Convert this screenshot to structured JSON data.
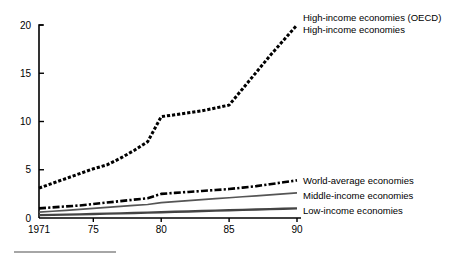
{
  "chart_data": {
    "type": "line",
    "title": "",
    "xlabel": "",
    "ylabel": "",
    "xlim": [
      1971,
      1990
    ],
    "ylim": [
      0,
      20
    ],
    "grid": false,
    "legend_position": "right-inline",
    "x_ticks": [
      "1971",
      "75",
      "80",
      "85",
      "90"
    ],
    "x_tick_values": [
      1971,
      1975,
      1980,
      1985,
      1990
    ],
    "y_ticks": [
      "0",
      "5",
      "10",
      "15",
      "20"
    ],
    "y_tick_values": [
      0,
      5,
      10,
      15,
      20
    ],
    "x": [
      1971,
      1972,
      1973,
      1974,
      1975,
      1976,
      1977,
      1978,
      1979,
      1980,
      1981,
      1982,
      1983,
      1984,
      1985,
      1986,
      1987,
      1988,
      1989,
      1990
    ],
    "series": [
      {
        "name": "High-income economies (OECD)",
        "style": "dotted-thick",
        "color": "#000000",
        "values": [
          3.1,
          3.6,
          4.1,
          4.6,
          5.1,
          5.5,
          6.2,
          7.0,
          7.9,
          10.5,
          10.7,
          10.9,
          11.1,
          11.4,
          11.7,
          13.4,
          15.1,
          16.8,
          18.4,
          20.0
        ]
      },
      {
        "name": "High-income economies",
        "style": "dotted-thick",
        "color": "#000000",
        "values": [
          3.1,
          3.6,
          4.1,
          4.6,
          5.1,
          5.5,
          6.2,
          7.0,
          7.9,
          10.5,
          10.7,
          10.9,
          11.1,
          11.4,
          11.7,
          13.4,
          15.1,
          16.8,
          18.4,
          20.0
        ]
      },
      {
        "name": "World-average economies",
        "style": "dash-dot",
        "color": "#000000",
        "values": [
          1.0,
          1.1,
          1.2,
          1.3,
          1.45,
          1.6,
          1.75,
          1.9,
          2.05,
          2.5,
          2.6,
          2.7,
          2.8,
          2.9,
          3.0,
          3.15,
          3.3,
          3.5,
          3.7,
          3.9
        ]
      },
      {
        "name": "Middle-income economies",
        "style": "solid-thin",
        "color": "#555555",
        "values": [
          0.6,
          0.7,
          0.8,
          0.9,
          1.0,
          1.1,
          1.2,
          1.3,
          1.4,
          1.6,
          1.7,
          1.8,
          1.9,
          2.0,
          2.1,
          2.2,
          2.3,
          2.4,
          2.5,
          2.6
        ]
      },
      {
        "name": "Low-income economies",
        "style": "solid-medium",
        "color": "#444444",
        "values": [
          0.3,
          0.32,
          0.35,
          0.38,
          0.42,
          0.45,
          0.48,
          0.52,
          0.56,
          0.6,
          0.64,
          0.68,
          0.72,
          0.76,
          0.8,
          0.84,
          0.88,
          0.92,
          0.96,
          1.0
        ]
      }
    ],
    "annotations": [
      {
        "text": "High-income economies (OECD)",
        "x": 1990,
        "y": 20.0
      },
      {
        "text": "High-income economies",
        "x": 1990,
        "y": 18.6
      },
      {
        "text": "World-average economies",
        "x": 1990,
        "y": 3.9
      },
      {
        "text": "Middle-income economies",
        "x": 1990,
        "y": 2.6
      },
      {
        "text": "Low-income economies",
        "x": 1990,
        "y": 1.0
      }
    ]
  },
  "legend": {
    "items": [
      {
        "label": "High-income economies (OECD)"
      },
      {
        "label": "High-income economies"
      },
      {
        "label": "World-average economies"
      },
      {
        "label": "Middle-income economies"
      },
      {
        "label": "Low-income economies"
      }
    ]
  },
  "axes": {
    "y_label_20": "20",
    "y_label_15": "15",
    "y_label_10": "10",
    "y_label_5": "5",
    "y_label_0": "0",
    "x_label_1971": "1971",
    "x_label_75": "75",
    "x_label_80": "80",
    "x_label_85": "85",
    "x_label_90": "90"
  }
}
